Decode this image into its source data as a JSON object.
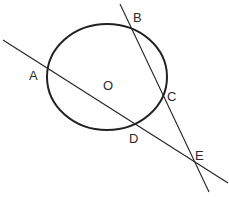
{
  "diagram": {
    "type": "geometry",
    "colors": {
      "stroke": "#222222",
      "label": "#2a2a2a",
      "background": "#ffffff"
    },
    "circle": {
      "center_label": "O",
      "cx": 107,
      "cy": 77,
      "rx": 60,
      "ry": 53
    },
    "lines": [
      {
        "name": "secant-ADE",
        "points": [
          "A",
          "D",
          "E"
        ],
        "x1": 3,
        "y1": 40,
        "x2": 228,
        "y2": 183
      },
      {
        "name": "secant-BCE",
        "points": [
          "B",
          "C",
          "E"
        ],
        "x1": 120,
        "y1": 4,
        "x2": 209,
        "y2": 192
      }
    ],
    "labels": {
      "A": "A",
      "B": "B",
      "C": "C",
      "D": "D",
      "E": "E",
      "O": "O"
    }
  }
}
